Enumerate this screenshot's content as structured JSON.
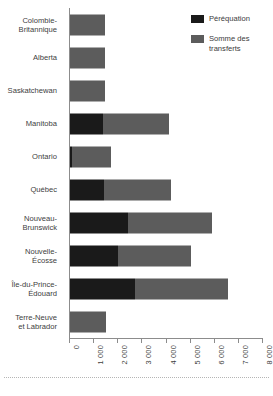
{
  "chart_data": {
    "type": "bar",
    "orientation": "horizontal",
    "stacked": true,
    "title": "",
    "xlabel": "",
    "ylabel": "",
    "xlim": [
      0,
      8000
    ],
    "xticks": [
      0,
      1000,
      2000,
      3000,
      4000,
      5000,
      6000,
      7000,
      8000
    ],
    "xtick_labels": [
      "0",
      "1 000",
      "2 000",
      "3 000",
      "4 000",
      "5 000",
      "6 000",
      "7 000",
      "8 000"
    ],
    "grid": false,
    "legend_position": "top-right",
    "categories": [
      "Colombie-\nBritannique",
      "Alberta",
      "Saskatchewan",
      "Manitoba",
      "Ontario",
      "Québec",
      "Nouveau-\nBrunswick",
      "Nouvelle-\nÉcosse",
      "Île-du-Prince-\nÉdouard",
      "Terre-Neuve\net Labrador"
    ],
    "series": [
      {
        "name": "Péréquation",
        "color": "#1a1a1a",
        "values": [
          0,
          0,
          0,
          1350,
          80,
          1400,
          2400,
          2000,
          2700,
          0
        ]
      },
      {
        "name": "Somme des transferts",
        "color": "#5c5c5c",
        "values": [
          1450,
          1450,
          1450,
          2750,
          1620,
          2800,
          3500,
          3000,
          3850,
          1500
        ]
      }
    ],
    "totals": [
      1450,
      1450,
      1450,
      4100,
      1700,
      4200,
      5900,
      5000,
      6550,
      1500
    ]
  },
  "legend": {
    "items": [
      {
        "label": "Péréquation",
        "color": "#1a1a1a",
        "swatch": "black"
      },
      {
        "label": "Somme des\ntransferts",
        "color": "#5c5c5c",
        "swatch": "gray"
      }
    ]
  },
  "footer": {
    "note": ""
  }
}
